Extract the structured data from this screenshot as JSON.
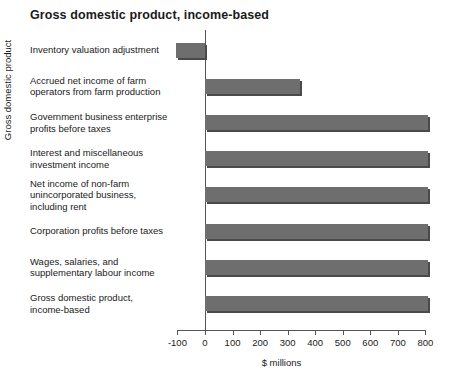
{
  "chart_data": {
    "type": "bar",
    "orientation": "horizontal",
    "title": "Gross domestic product, income-based",
    "xlabel": "$ millions",
    "ylabel": "Gross domestic product",
    "xlim": [
      -100,
      800
    ],
    "xticks": [
      -100,
      0,
      100,
      200,
      300,
      400,
      500,
      600,
      700,
      800
    ],
    "xtick_labels": [
      "-100",
      "0",
      "100",
      "200",
      "300",
      "400",
      "500",
      "600",
      "700",
      "800"
    ],
    "grid": false,
    "legend": null,
    "bar_color": "#6e6e6e",
    "bar_edge_color": "#4a4a4a",
    "categories": [
      "Inventory valuation adjustment",
      "Accrued net income of farm operators from farm production",
      "Government business enterprise profits before taxes",
      "Interest and miscellaneous investment income",
      "Net income of non-farm unincorporated business, including rent",
      "Corporation profits before taxes",
      "Wages, salaries, and supplementary labour income",
      "Gross domestic product, income-based"
    ],
    "category_lines": [
      [
        "Inventory valuation adjustment"
      ],
      [
        "Accrued net income of farm",
        "operators from farm production"
      ],
      [
        "Government business enterprise",
        "profits before taxes"
      ],
      [
        "Interest and miscellaneous",
        "investment income"
      ],
      [
        "Net income of non-farm",
        "unincorporated business,",
        "including rent"
      ],
      [
        "Corporation profits before taxes"
      ],
      [
        "Wages, salaries, and",
        "supplementary labour income"
      ],
      [
        "Gross domestic product,",
        "income-based"
      ]
    ],
    "values": [
      -105,
      345,
      810,
      810,
      810,
      810,
      810,
      810
    ]
  }
}
